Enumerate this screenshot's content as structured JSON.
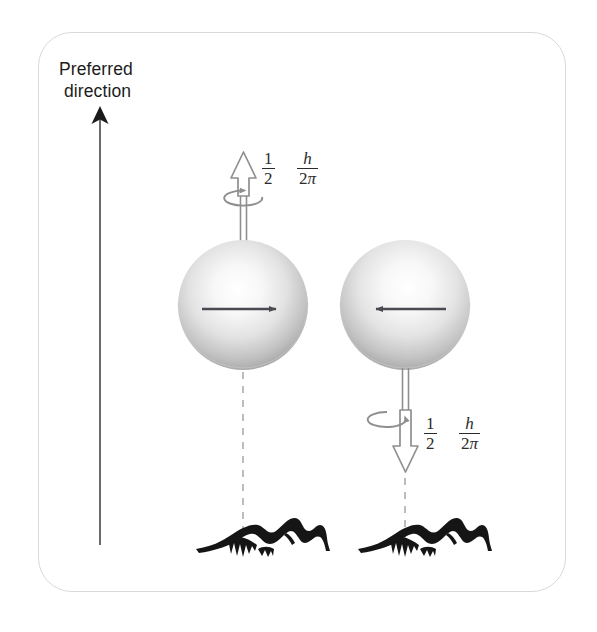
{
  "figure": {
    "background_color": "#ffffff",
    "panel": {
      "border_color": "#d9d9d9",
      "corner_radius": 34
    },
    "axis_label": {
      "line1": "Preferred",
      "line2": "direction",
      "color": "#1c1c1c"
    },
    "arrow_preferred_direction": {
      "name": "preferred-direction-arrow",
      "direction": "up",
      "color": "#222222",
      "from_y": 545,
      "to_y": 110,
      "x": 100
    },
    "particles": [
      {
        "id": "particle-left",
        "center_x": 243,
        "center_y": 305,
        "radius": 65,
        "sphere_color_light": "#fdfdfd",
        "sphere_color_dark": "#8e8e8e",
        "equator_arrow_direction": "right",
        "equator_arrow_color": "#4a4a52",
        "spin_arrow": {
          "direction": "up",
          "position": "above",
          "color": "#9a9a9a",
          "rotation_sense": "counterclockwise"
        },
        "spin_value": {
          "coefficient_num": "1",
          "coefficient_den": "2",
          "quantity_num": "h",
          "quantity_den_prefix": "2",
          "quantity_den_symbol": "π"
        },
        "dashed_line": {
          "color": "#a8a8a8",
          "from_y": 372,
          "to_y": 540
        },
        "terrain": "mountain-range-sketch"
      },
      {
        "id": "particle-right",
        "center_x": 405,
        "center_y": 305,
        "radius": 65,
        "sphere_color_light": "#fdfdfd",
        "sphere_color_dark": "#8e8e8e",
        "equator_arrow_direction": "left",
        "equator_arrow_color": "#4a4a52",
        "spin_arrow": {
          "direction": "down",
          "position": "below",
          "color": "#9a9a9a",
          "rotation_sense": "clockwise"
        },
        "spin_value": {
          "coefficient_num": "1",
          "coefficient_den": "2",
          "quantity_num": "h",
          "quantity_den_prefix": "2",
          "quantity_den_symbol": "π"
        },
        "dashed_line": {
          "color": "#a8a8a8",
          "from_y": 472,
          "to_y": 540
        },
        "terrain": "mountain-range-sketch"
      }
    ]
  }
}
